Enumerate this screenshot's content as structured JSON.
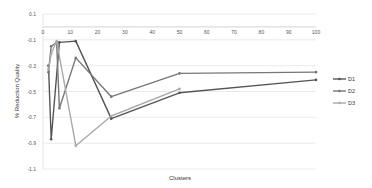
{
  "chart_data": {
    "type": "line",
    "title": "",
    "xlabel": "Clusters",
    "ylabel": "% Reduction Quality",
    "xlim": [
      0,
      100
    ],
    "ylim": [
      -1.1,
      0.1
    ],
    "x_ticks": [
      0,
      10,
      20,
      30,
      40,
      50,
      60,
      70,
      80,
      90,
      100
    ],
    "y_ticks": [
      0.1,
      -0.1,
      -0.3,
      -0.5,
      -0.7,
      -0.9,
      -1.1
    ],
    "y_tick_labels": [
      "0.1",
      "-0.1",
      "-0.3",
      "-0.5",
      "-0.7",
      "-0.9",
      "-1.1"
    ],
    "grid": true,
    "x_axis_at_y": 0,
    "legend_position": "right",
    "series": [
      {
        "name": "D1",
        "color": "#555555",
        "x": [
          2,
          3,
          6,
          12,
          25,
          50,
          100
        ],
        "values": [
          -0.3,
          -0.87,
          -0.12,
          -0.11,
          -0.71,
          -0.51,
          -0.41
        ]
      },
      {
        "name": "D2",
        "color": "#777777",
        "x": [
          2,
          3,
          5,
          6,
          12,
          25,
          50,
          100
        ],
        "values": [
          -0.35,
          -0.15,
          -0.12,
          -0.63,
          -0.24,
          -0.54,
          -0.36,
          -0.35
        ]
      },
      {
        "name": "D3",
        "color": "#aaaaaa",
        "x": [
          2,
          3,
          5,
          12,
          25,
          50
        ],
        "values": [
          -0.33,
          -0.21,
          -0.11,
          -0.92,
          -0.69,
          -0.48
        ]
      }
    ]
  },
  "legend": {
    "items": [
      "D1",
      "D2",
      "D3"
    ]
  }
}
